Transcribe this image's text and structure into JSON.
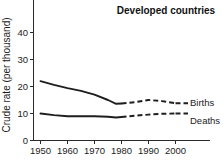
{
  "chart_data": {
    "type": "line",
    "title": "Developed countries",
    "xlabel": "",
    "ylabel": "Crude rate (per thousand)",
    "xlim": [
      1946,
      2006
    ],
    "ylim": [
      0,
      44
    ],
    "yticks": [
      0,
      10,
      20,
      30,
      40
    ],
    "ytick_labels": [
      "0",
      "10",
      "20",
      "30",
      "40"
    ],
    "xticks": [
      1950,
      1960,
      1970,
      1980,
      1990,
      2000
    ],
    "xtick_labels": [
      "1950",
      "1960",
      "1970",
      "1980",
      "1990",
      "2000"
    ],
    "grid": false,
    "legend_position": "right-inline",
    "solid_until": 1980,
    "series": [
      {
        "name": "Births",
        "label": "Births",
        "color": "#1e1e1e",
        "x": [
          1950,
          1955,
          1960,
          1965,
          1970,
          1975,
          1978,
          1980,
          1985,
          1990,
          1995,
          2000
        ],
        "values": [
          22.0,
          20.6,
          19.4,
          18.4,
          17.0,
          15.0,
          13.6,
          13.7,
          14.2,
          15.0,
          14.6,
          13.8
        ]
      },
      {
        "name": "Deaths",
        "label": "Deaths",
        "color": "#1e1e1e",
        "x": [
          1950,
          1955,
          1960,
          1965,
          1970,
          1975,
          1978,
          1980,
          1985,
          1990,
          1995,
          2000
        ],
        "values": [
          10.0,
          9.4,
          9.0,
          9.0,
          9.0,
          8.8,
          8.5,
          8.7,
          9.2,
          9.6,
          9.9,
          10.0
        ]
      }
    ]
  },
  "labels": {
    "title": "Developed countries",
    "ylabel": "Crude rate (per thousand)",
    "births": "Births",
    "deaths": "Deaths",
    "y0": "0",
    "y10": "10",
    "y20": "20",
    "y30": "30",
    "y40": "40",
    "x1950": "1950",
    "x1960": "1960",
    "x1970": "1970",
    "x1980": "1980",
    "x1990": "1990",
    "x2000": "2000"
  }
}
